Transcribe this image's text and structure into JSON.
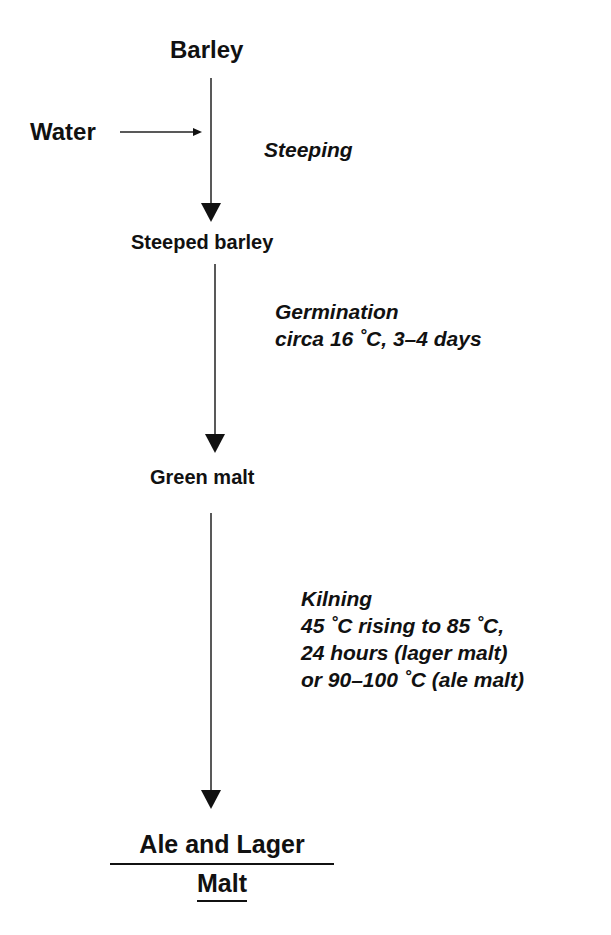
{
  "diagram": {
    "type": "process-flow",
    "nodes": {
      "barley": "Barley",
      "water": "Water",
      "steeped_barley": "Steeped barley",
      "green_malt": "Green malt",
      "final_line1": "Ale and Lager",
      "final_line2": "Malt"
    },
    "steps": {
      "steeping": "Steeping",
      "germination": "Germination\ncirca 16 ˚C, 3–4 days",
      "kilning": "Kilning\n45 ˚C rising to 85 ˚C,\n24 hours (lager malt)\nor 90–100 ˚C (ale malt)"
    },
    "edges": [
      {
        "from": "Barley",
        "to": "Steeped barley",
        "label": "Steeping"
      },
      {
        "from": "Water",
        "to": "Steeping",
        "label": ""
      },
      {
        "from": "Steeped barley",
        "to": "Green malt",
        "label": "Germination circa 16 ˚C, 3–4 days"
      },
      {
        "from": "Green malt",
        "to": "Ale and Lager Malt",
        "label": "Kilning 45 ˚C rising to 85 ˚C, 24 hours (lager malt) or 90–100 ˚C (ale malt)"
      }
    ]
  }
}
